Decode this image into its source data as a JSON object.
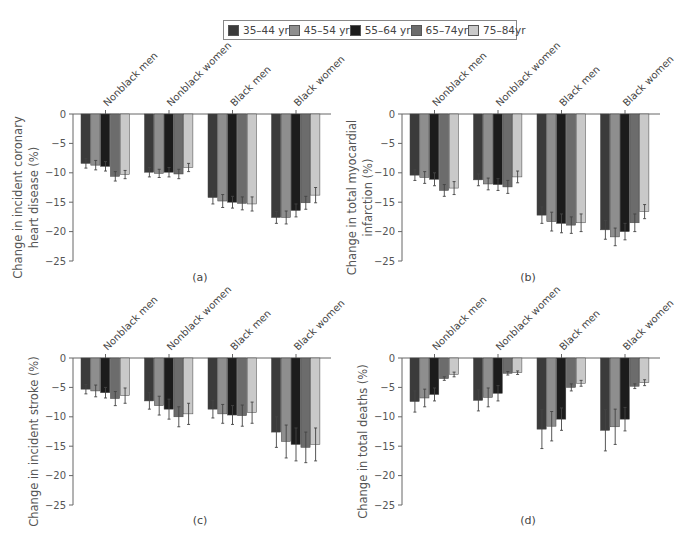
{
  "legend": {
    "items": [
      {
        "label": "35–44 yr",
        "color": "#3b3b3b"
      },
      {
        "label": "45–54 yr",
        "color": "#8e8e8e"
      },
      {
        "label": "55–64 yr",
        "color": "#1c1c1c"
      },
      {
        "label": "65–74yr",
        "color": "#6c6c6c"
      },
      {
        "label": "75–84yr",
        "color": "#c9c9c9"
      }
    ]
  },
  "chart_data": [
    {
      "type": "bar",
      "panel": "(a)",
      "title": "",
      "ylabel": "Change in incident coronary heart disease (%)",
      "ylabel_lines": [
        "Change in incident coronary",
        "heart disease (%)"
      ],
      "xlabel": "",
      "ylim": [
        -25,
        0
      ],
      "yticks": [
        0,
        -5,
        -10,
        -15,
        -20,
        -25
      ],
      "categories": [
        "Nonblack men",
        "Nonblack women",
        "Black men",
        "Black women"
      ],
      "series": [
        {
          "name": "35–44 yr",
          "values": [
            -8.4,
            -9.9,
            -14.2,
            -17.6
          ],
          "err": [
            0.8,
            0.8,
            1.1,
            1.0
          ]
        },
        {
          "name": "45–54 yr",
          "values": [
            -8.7,
            -10.1,
            -14.8,
            -17.6
          ],
          "err": [
            0.8,
            0.7,
            1.1,
            1.1
          ]
        },
        {
          "name": "55–64 yr",
          "values": [
            -8.9,
            -9.9,
            -15.0,
            -16.4
          ],
          "err": [
            0.8,
            0.8,
            1.0,
            1.1
          ]
        },
        {
          "name": "65–74yr",
          "values": [
            -10.6,
            -10.2,
            -15.2,
            -15.1
          ],
          "err": [
            0.8,
            0.8,
            1.1,
            1.1
          ]
        },
        {
          "name": "75–84yr",
          "values": [
            -10.3,
            -9.1,
            -15.3,
            -13.8
          ],
          "err": [
            0.7,
            0.7,
            1.2,
            1.3
          ]
        }
      ],
      "grid": false,
      "legend_position": "top"
    },
    {
      "type": "bar",
      "panel": "(b)",
      "title": "",
      "ylabel": "Change in total myocardial infarction (%)",
      "ylabel_lines": [
        "Change in total myocardial",
        "infarction (%)"
      ],
      "xlabel": "",
      "ylim": [
        -25,
        0
      ],
      "yticks": [
        0,
        -5,
        -10,
        -15,
        -20,
        -25
      ],
      "categories": [
        "Nonblack men",
        "Nonblack women",
        "Black men",
        "Black women"
      ],
      "series": [
        {
          "name": "35–44 yr",
          "values": [
            -10.4,
            -11.2,
            -17.2,
            -19.7
          ],
          "err": [
            0.9,
            1.0,
            1.4,
            1.6
          ]
        },
        {
          "name": "45–54 yr",
          "values": [
            -10.8,
            -11.9,
            -18.3,
            -20.9
          ],
          "err": [
            1.0,
            1.0,
            1.6,
            1.5
          ]
        },
        {
          "name": "55–64 yr",
          "values": [
            -11.1,
            -12.0,
            -18.6,
            -20.0
          ],
          "err": [
            1.1,
            1.0,
            1.6,
            1.4
          ]
        },
        {
          "name": "65–74yr",
          "values": [
            -13.0,
            -12.4,
            -18.9,
            -18.5
          ],
          "err": [
            1.0,
            1.1,
            1.4,
            1.5
          ]
        },
        {
          "name": "75–84yr",
          "values": [
            -12.6,
            -10.7,
            -18.5,
            -16.6
          ],
          "err": [
            1.1,
            1.0,
            1.5,
            1.2
          ]
        }
      ],
      "grid": false,
      "legend_position": "top"
    },
    {
      "type": "bar",
      "panel": "(c)",
      "title": "",
      "ylabel": "Change in incident stroke (%)",
      "ylabel_lines": [
        "Change in incident stroke (%)"
      ],
      "xlabel": "",
      "ylim": [
        -25,
        0
      ],
      "yticks": [
        0,
        -5,
        -10,
        -15,
        -20,
        -25
      ],
      "categories": [
        "Nonblack men",
        "Nonblack women",
        "Black men",
        "Black women"
      ],
      "series": [
        {
          "name": "35–44 yr",
          "values": [
            -5.3,
            -7.3,
            -8.7,
            -12.6
          ],
          "err": [
            0.8,
            1.4,
            1.5,
            2.6
          ]
        },
        {
          "name": "45–54 yr",
          "values": [
            -5.6,
            -8.1,
            -9.5,
            -14.2
          ],
          "err": [
            1.0,
            1.6,
            1.6,
            2.8
          ]
        },
        {
          "name": "55–64 yr",
          "values": [
            -5.9,
            -8.7,
            -9.7,
            -14.7
          ],
          "err": [
            0.9,
            1.7,
            1.6,
            2.8
          ]
        },
        {
          "name": "65–74yr",
          "values": [
            -6.9,
            -10.0,
            -9.8,
            -15.2
          ],
          "err": [
            1.2,
            1.7,
            1.8,
            2.6
          ]
        },
        {
          "name": "75–84yr",
          "values": [
            -6.4,
            -9.5,
            -9.3,
            -14.7
          ],
          "err": [
            1.3,
            1.8,
            1.8,
            2.8
          ]
        }
      ],
      "grid": false,
      "legend_position": "top"
    },
    {
      "type": "bar",
      "panel": "(d)",
      "title": "",
      "ylabel": "Change in total deaths (%)",
      "ylabel_lines": [
        "Change in total deaths (%)"
      ],
      "xlabel": "",
      "ylim": [
        -25,
        0
      ],
      "yticks": [
        0,
        -5,
        -10,
        -15,
        -20,
        -25
      ],
      "categories": [
        "Nonblack men",
        "Nonblack women",
        "Black men",
        "Black women"
      ],
      "series": [
        {
          "name": "35–44 yr",
          "values": [
            -7.4,
            -7.2,
            -12.1,
            -12.3
          ],
          "err": [
            1.8,
            1.8,
            3.3,
            3.5
          ]
        },
        {
          "name": "45–54 yr",
          "values": [
            -6.8,
            -6.7,
            -11.6,
            -11.7
          ],
          "err": [
            1.5,
            1.6,
            2.5,
            3.0
          ]
        },
        {
          "name": "55–64 yr",
          "values": [
            -6.2,
            -6.0,
            -10.4,
            -10.4
          ],
          "err": [
            1.1,
            1.3,
            1.9,
            2.0
          ]
        },
        {
          "name": "65–74yr",
          "values": [
            -3.5,
            -2.6,
            -5.0,
            -4.8
          ],
          "err": [
            0.3,
            0.3,
            0.6,
            0.4
          ]
        },
        {
          "name": "75–84yr",
          "values": [
            -2.8,
            -2.5,
            -4.3,
            -4.2
          ],
          "err": [
            0.4,
            0.3,
            0.5,
            0.5
          ]
        }
      ],
      "grid": false,
      "legend_position": "top"
    }
  ],
  "layout": {
    "panels": [
      {
        "axis_x": 73,
        "zero_y": 114,
        "bottom_y": 261,
        "group_start": 81,
        "label_x": 200,
        "label_y": 281,
        "ylabel_x": [
          22,
          38
        ]
      },
      {
        "axis_x": 402,
        "zero_y": 114,
        "bottom_y": 261,
        "group_start": 410,
        "label_x": 528,
        "label_y": 281,
        "ylabel_x": [
          356,
          372
        ]
      },
      {
        "axis_x": 73,
        "zero_y": 358,
        "bottom_y": 505,
        "group_start": 81,
        "label_x": 200,
        "label_y": 524,
        "ylabel_x": [
          38
        ]
      },
      {
        "axis_x": 402,
        "zero_y": 358,
        "bottom_y": 505,
        "group_start": 410,
        "label_x": 528,
        "label_y": 524,
        "ylabel_x": [
          367
        ]
      }
    ],
    "bar_width": 9.8,
    "group_pitch": 63.5,
    "axis_right_extent": 258
  }
}
